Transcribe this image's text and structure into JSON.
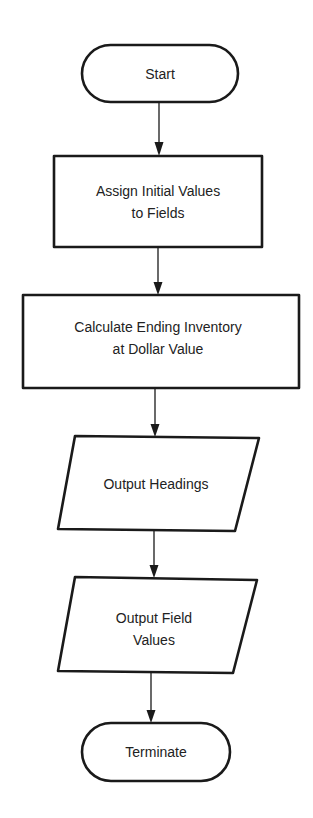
{
  "flowchart": {
    "colors": {
      "stroke": "#1a1a1a",
      "text": "#222222",
      "background": "#ffffff"
    },
    "nodes": [
      {
        "id": "start",
        "type": "terminal",
        "lines": [
          "Start"
        ]
      },
      {
        "id": "assign",
        "type": "process",
        "lines": [
          "Assign Initial Values",
          "to Fields"
        ]
      },
      {
        "id": "calculate",
        "type": "process",
        "lines": [
          "Calculate Ending Inventory",
          "at Dollar Value"
        ]
      },
      {
        "id": "output_headings",
        "type": "input-output",
        "lines": [
          "Output Headings"
        ]
      },
      {
        "id": "output_values",
        "type": "input-output",
        "lines": [
          "Output Field",
          "Values"
        ]
      },
      {
        "id": "terminate",
        "type": "terminal",
        "lines": [
          "Terminate"
        ]
      }
    ],
    "edges": [
      {
        "from": "start",
        "to": "assign"
      },
      {
        "from": "assign",
        "to": "calculate"
      },
      {
        "from": "calculate",
        "to": "output_headings"
      },
      {
        "from": "output_headings",
        "to": "output_values"
      },
      {
        "from": "output_values",
        "to": "terminate"
      }
    ]
  }
}
